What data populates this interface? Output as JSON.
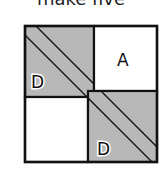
{
  "title": "make five",
  "figure": {
    "colors": {
      "shaded": "#b8b8b8",
      "border": "#111111",
      "background": "#ffffff"
    },
    "regions": [
      {
        "id": "top-left",
        "shaded": true,
        "label": "D"
      },
      {
        "id": "top-right",
        "shaded": false,
        "label": "A"
      },
      {
        "id": "bottom-left",
        "shaded": false,
        "label": ""
      },
      {
        "id": "bottom-right",
        "shaded": true,
        "label": "D"
      }
    ],
    "diagonal_band": true
  }
}
